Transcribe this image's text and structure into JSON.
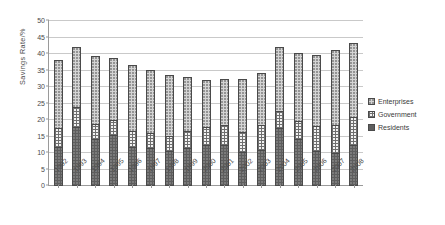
{
  "chart_data": {
    "type": "bar",
    "subtype": "stacked-bar",
    "title": "",
    "xlabel": "",
    "ylabel": "Savings Rate/%",
    "ylim": [
      0,
      50
    ],
    "yticks": [
      0,
      5,
      10,
      15,
      20,
      25,
      30,
      35,
      40,
      45,
      50
    ],
    "grid": true,
    "legend_position": "right",
    "categories": [
      "1992",
      "1993",
      "1994",
      "1995",
      "1996",
      "1997",
      "1998",
      "1999",
      "2000",
      "2001",
      "2002",
      "2003",
      "2004",
      "2005",
      "2006",
      "2007",
      "2008"
    ],
    "series": [
      {
        "name": "Residents",
        "values": [
          11.8,
          18.0,
          14.3,
          15.5,
          11.9,
          11.4,
          10.6,
          11.5,
          12.3,
          12.5,
          10.3,
          11.0,
          17.5,
          14.1,
          10.7,
          9.9,
          12.5
        ]
      },
      {
        "name": "Government",
        "values": [
          6.0,
          6.2,
          4.9,
          4.8,
          5.2,
          5.1,
          4.9,
          5.5,
          6.0,
          6.3,
          6.4,
          7.8,
          5.6,
          5.9,
          7.8,
          8.8,
          8.6
        ]
      },
      {
        "name": "Enterprises",
        "values": [
          20.9,
          18.6,
          20.9,
          19.0,
          20.1,
          19.4,
          18.7,
          16.6,
          14.5,
          14.2,
          16.3,
          16.1,
          19.6,
          20.8,
          21.7,
          23.0,
          22.7
        ]
      }
    ],
    "totals": [
      38.7,
      42.8,
      40.1,
      39.3,
      37.2,
      35.9,
      34.2,
      33.6,
      32.8,
      33.0,
      33.0,
      34.9,
      42.7,
      40.8,
      40.2,
      41.7,
      43.8
    ]
  },
  "legend": {
    "items": [
      {
        "label": "Enterprises",
        "swatch": "enterprises-swatch"
      },
      {
        "label": "Government",
        "swatch": "government-swatch"
      },
      {
        "label": "Residents",
        "swatch": "residents-swatch"
      }
    ]
  }
}
